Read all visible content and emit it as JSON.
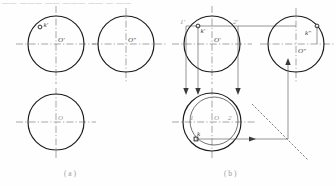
{
  "figure": {
    "title_strip": "—— ——— —— ———  ——  — ——",
    "captions": {
      "left": "( a )",
      "right": "( b )"
    }
  },
  "panel_a": {
    "name": "given-problem",
    "front_view": {
      "center_label": "O'",
      "point_label": "k'",
      "circle": {
        "cx": 56,
        "cy": 44,
        "r": 28
      },
      "point": {
        "x": 40,
        "y": 27
      },
      "center_h_line": {
        "x1": 16,
        "y1": 44,
        "x2": 96,
        "y2": 44
      },
      "center_v_line": {
        "x1": 56,
        "y1": 6,
        "x2": 56,
        "y2": 84
      }
    },
    "side_view": {
      "center_label": "O″",
      "circle": {
        "cx": 126,
        "cy": 44,
        "r": 28
      },
      "center_h_line": {
        "x1": 92,
        "y1": 44,
        "x2": 166,
        "y2": 44
      },
      "center_v_line": {
        "x1": 126,
        "y1": 8,
        "x2": 126,
        "y2": 82
      }
    },
    "top_view": {
      "center_label": "O",
      "circle": {
        "cx": 56,
        "cy": 122,
        "r": 28
      },
      "center_h_line": {
        "x1": 16,
        "y1": 122,
        "x2": 96,
        "y2": 122
      },
      "center_v_line": {
        "x1": 56,
        "y1": 88,
        "x2": 56,
        "y2": 158
      }
    }
  },
  "panel_b": {
    "name": "solution-construction",
    "front_view": {
      "center_label": "O'",
      "point_label": "k'",
      "aux_label_1": "1'",
      "aux_label_2": "2'",
      "circle": {
        "cx": 212,
        "cy": 44,
        "r": 28
      },
      "point": {
        "x": 198,
        "y": 26
      },
      "center_h_line": {
        "x1": 172,
        "y1": 44,
        "x2": 252,
        "y2": 44
      },
      "center_v_line": {
        "x1": 212,
        "y1": 6,
        "x2": 212,
        "y2": 84
      },
      "chord_line": {
        "x1": 186,
        "y1": 26,
        "x2": 296,
        "y2": 26
      }
    },
    "side_view": {
      "center_label": "O″",
      "point_label": "k″",
      "circle": {
        "cx": 296,
        "cy": 44,
        "r": 28
      },
      "point": {
        "x": 317,
        "y": 26
      },
      "center_h_line": {
        "x1": 260,
        "y1": 44,
        "x2": 334,
        "y2": 44
      },
      "center_v_line": {
        "x1": 296,
        "y1": 8,
        "x2": 296,
        "y2": 82
      }
    },
    "top_view": {
      "center_label": "O",
      "point_label": "k",
      "aux_label_1": "1",
      "aux_label_2": "2",
      "circle": {
        "cx": 212,
        "cy": 122,
        "r": 29
      },
      "inner_ellipse": {
        "cx": 214,
        "cy": 121,
        "rx": 24,
        "ry": 24
      },
      "point": {
        "x": 196,
        "y": 139
      },
      "center_h_line": {
        "x1": 172,
        "y1": 122,
        "x2": 256,
        "y2": 122
      },
      "center_v_line": {
        "x1": 212,
        "y1": 88,
        "x2": 212,
        "y2": 158
      }
    },
    "miter_line": {
      "x1": 252,
      "y1": 104,
      "x2": 306,
      "y2": 158
    },
    "projection_arrows": [
      {
        "name": "vertical-drop-1",
        "x": 186,
        "y1": 26,
        "y2": 93,
        "dir": "down"
      },
      {
        "name": "vertical-drop-2",
        "x": 198,
        "y1": 26,
        "y2": 93,
        "dir": "down"
      },
      {
        "name": "vertical-drop-3",
        "x": 238,
        "y1": 26,
        "y2": 93,
        "dir": "down"
      },
      {
        "name": "horizontal-to-miter",
        "y": 139,
        "x1": 196,
        "x2": 288,
        "dir": "right"
      },
      {
        "name": "miter-to-side-view",
        "x": 288,
        "y1": 139,
        "y2": 60,
        "dir": "up"
      }
    ]
  }
}
